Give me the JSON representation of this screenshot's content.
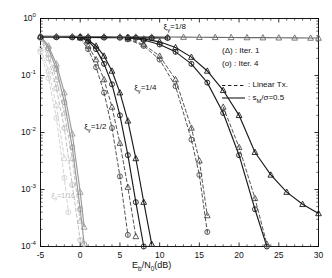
{
  "chart_data": {
    "type": "line",
    "title": "",
    "xlabel": "E_b/N_0(dB)",
    "ylabel": "BER",
    "xlim": [
      -5,
      30
    ],
    "ylim": [
      0.0001,
      1
    ],
    "yscale": "log",
    "xticks": [
      -5,
      0,
      5,
      10,
      15,
      20,
      25,
      30
    ],
    "xticklabels": [
      "-5",
      "0",
      "5",
      "10",
      "15",
      "20",
      "25",
      "30"
    ],
    "yticks": [
      1,
      0.1,
      0.01,
      0.001,
      0.0001
    ],
    "yticklabels": [
      "10^0",
      "10^-1",
      "10^-2",
      "10^-3",
      "10^-4"
    ],
    "grid": false,
    "legend_position": "right-top",
    "series": [
      {
        "name": "xi=1/2, Iter.1, Linear Tx.",
        "group": "xi_1_2",
        "iter": 1,
        "marker": "triangle",
        "style": "dashed",
        "color": "#bdbdbd",
        "x": [
          -5,
          -4,
          -3,
          -2,
          -1,
          0
        ],
        "y": [
          0.47,
          0.24,
          0.085,
          0.022,
          0.0035,
          0.00028
        ]
      },
      {
        "name": "xi=1/2, Iter.4, Linear Tx.",
        "group": "xi_1_2",
        "iter": 4,
        "marker": "circle",
        "style": "dashed",
        "color": "#bdbdbd",
        "x": [
          -5,
          -4,
          -3,
          -2,
          -1,
          0
        ],
        "y": [
          0.45,
          0.2,
          0.06,
          0.012,
          0.0012,
          0.00013
        ]
      },
      {
        "name": "xi=1/2, Iter.1, sM/sigma=0.5",
        "group": "xi_1_2",
        "iter": 1,
        "marker": "triangle",
        "style": "solid",
        "color": "#9a9a9a",
        "x": [
          -5,
          -4,
          -3,
          -2,
          -1,
          0,
          0.5
        ],
        "y": [
          0.49,
          0.33,
          0.16,
          0.05,
          0.0095,
          0.0009,
          0.00022
        ]
      },
      {
        "name": "xi=1/2, Iter.4, sM/sigma=0.5",
        "group": "xi_1_2",
        "iter": 4,
        "marker": "circle",
        "style": "solid",
        "color": "#9a9a9a",
        "x": [
          -5,
          -4,
          -3,
          -2,
          -1,
          0,
          0.5
        ],
        "y": [
          0.48,
          0.3,
          0.13,
          0.034,
          0.0055,
          0.00045,
          0.00011
        ]
      },
      {
        "name": "xi=1/4, Iter.1, Linear Tx.",
        "group": "xi_1_4",
        "iter": 1,
        "marker": "triangle",
        "style": "dashed",
        "color": "#4a4a4a",
        "x": [
          0,
          1,
          2,
          3,
          4,
          5,
          6,
          7
        ],
        "y": [
          0.46,
          0.33,
          0.19,
          0.085,
          0.028,
          0.0065,
          0.0011,
          0.00015
        ]
      },
      {
        "name": "xi=1/4, Iter.4, Linear Tx.",
        "group": "xi_1_4",
        "iter": 4,
        "marker": "circle",
        "style": "dashed",
        "color": "#4a4a4a",
        "x": [
          0,
          1,
          2,
          3,
          4,
          5,
          6
        ],
        "y": [
          0.45,
          0.29,
          0.14,
          0.05,
          0.012,
          0.0017,
          0.00016
        ]
      },
      {
        "name": "xi=1/4, Iter.1, sM/sigma=0.5",
        "group": "xi_1_4",
        "iter": 1,
        "marker": "triangle",
        "style": "solid",
        "color": "#1a1a1a",
        "x": [
          0,
          1,
          2,
          3,
          4,
          5,
          6,
          7,
          8,
          9
        ],
        "y": [
          0.48,
          0.42,
          0.33,
          0.22,
          0.12,
          0.05,
          0.016,
          0.0035,
          0.0006,
          0.00011
        ]
      },
      {
        "name": "xi=1/4, Iter.4, sM/sigma=0.5",
        "group": "xi_1_4",
        "iter": 4,
        "marker": "circle",
        "style": "solid",
        "color": "#1a1a1a",
        "x": [
          0,
          1,
          2,
          3,
          4,
          5,
          6,
          7,
          8
        ],
        "y": [
          0.47,
          0.4,
          0.29,
          0.16,
          0.07,
          0.02,
          0.004,
          0.0006,
          0.0001
        ]
      },
      {
        "name": "xi=1/8, Iter.1, Linear Tx.",
        "group": "xi_1_8",
        "iter": 1,
        "marker": "triangle",
        "style": "dashed",
        "color": "#4a4a4a",
        "x": [
          6,
          8,
          10,
          12,
          14,
          15,
          16
        ],
        "y": [
          0.44,
          0.35,
          0.22,
          0.085,
          0.012,
          0.0032,
          0.00035
        ]
      },
      {
        "name": "xi=1/8, Iter.4, Linear Tx.",
        "group": "xi_1_8",
        "iter": 4,
        "marker": "circle",
        "style": "dashed",
        "color": "#4a4a4a",
        "x": [
          6,
          8,
          10,
          12,
          14,
          15,
          16
        ],
        "y": [
          0.43,
          0.33,
          0.19,
          0.065,
          0.0075,
          0.0018,
          0.00018
        ]
      },
      {
        "name": "xi=1/8, Iter.4, sM/sigma=0.5",
        "group": "xi_1_8",
        "iter": 4,
        "marker": "circle",
        "style": "solid",
        "color": "#1a1a1a",
        "x": [
          6,
          8,
          10,
          12,
          14,
          16,
          18,
          20,
          22,
          23.5
        ],
        "y": [
          0.46,
          0.42,
          0.35,
          0.26,
          0.16,
          0.075,
          0.022,
          0.004,
          0.00045,
          0.0001
        ]
      },
      {
        "name": "xi=1/8, Iter.1, sM/sigma=0.5",
        "group": "xi_1_8",
        "iter": 1,
        "marker": "triangle",
        "style": "solid",
        "color": "#1a1a1a",
        "x": [
          6,
          8,
          10,
          12,
          14,
          16,
          18,
          20,
          22,
          24,
          26,
          28,
          30
        ],
        "y": [
          0.47,
          0.44,
          0.39,
          0.31,
          0.21,
          0.12,
          0.055,
          0.02,
          0.0045,
          0.0018,
          0.0009,
          0.00055,
          0.00038
        ]
      },
      {
        "name": "xi=1/8, Iter.1, Linear Tx. floor",
        "group": "xi_1_8",
        "iter": 1,
        "marker": "triangle",
        "style": "dashed",
        "color": "#4a4a4a",
        "x": [
          18,
          20,
          22,
          23.5
        ],
        "y": [
          0.028,
          0.0055,
          0.0007,
          0.00011
        ]
      },
      {
        "name": "xi=1/16 flat, Iter.1",
        "group": "xi_1_16",
        "iter": 1,
        "marker": "triangle",
        "style": "solid",
        "color": "#6a6a6a",
        "x": [
          -5,
          -3,
          -1,
          1,
          3,
          5,
          7,
          9,
          11,
          13,
          15,
          17,
          19,
          21,
          23,
          25,
          27,
          29,
          30
        ],
        "y": [
          0.49,
          0.487,
          0.485,
          0.483,
          0.481,
          0.479,
          0.477,
          0.475,
          0.473,
          0.471,
          0.469,
          0.467,
          0.465,
          0.463,
          0.461,
          0.459,
          0.457,
          0.455,
          0.454
        ]
      },
      {
        "name": "xi=1/16 flat, Iter.4",
        "group": "xi_1_16",
        "iter": 4,
        "marker": "circle",
        "style": "solid",
        "color": "#1a1a1a",
        "x": [
          -5,
          -3,
          -1,
          1,
          3,
          5,
          7,
          9,
          11
        ],
        "y": [
          0.47,
          0.468,
          0.466,
          0.464,
          0.462,
          0.46,
          0.458,
          0.456,
          0.454
        ]
      },
      {
        "name": "xi=1/16, Iter.1, Linear Tx.",
        "group": "xi_1_16",
        "iter": 1,
        "marker": "triangle",
        "style": "dashed",
        "color": "#d2d2d2",
        "x": [
          -5,
          -4,
          -3,
          -2
        ],
        "y": [
          0.3,
          0.12,
          0.03,
          0.0035
        ]
      },
      {
        "name": "xi=1/16, Iter.4, Linear Tx.",
        "group": "xi_1_16",
        "iter": 4,
        "marker": "circle",
        "style": "dashed",
        "color": "#d2d2d2",
        "x": [
          -5,
          -4,
          -3,
          -2,
          -1.5
        ],
        "y": [
          0.26,
          0.09,
          0.018,
          0.0016,
          0.0004
        ]
      }
    ],
    "annotations": [
      {
        "text": "ξγ=1/8",
        "x": 10.5,
        "y": 0.72,
        "faint": false
      },
      {
        "text": "ξγ=1/4",
        "x": 6.8,
        "y": 0.06,
        "faint": false
      },
      {
        "text": "ξγ=1/2",
        "x": 0.5,
        "y": 0.0125,
        "faint": false
      },
      {
        "text": "ξγ=1/16",
        "x": -3.6,
        "y": 0.00075,
        "faint": true
      }
    ],
    "legend": [
      {
        "symbol": "(Δ)",
        "sep": " : ",
        "label": "Iter. 1",
        "kind": "marker"
      },
      {
        "symbol": "(o)",
        "sep": " : ",
        "label": "Iter. 4",
        "kind": "marker"
      },
      {
        "symbol": "dashed",
        "sep": " : ",
        "label": "Linear Tx.",
        "kind": "line"
      },
      {
        "symbol": "solid",
        "sep": " : ",
        "label": "s_M/σ=0.5",
        "kind": "line"
      }
    ]
  },
  "figure": {
    "background": "#ffffff",
    "axis_color": "#000000"
  }
}
